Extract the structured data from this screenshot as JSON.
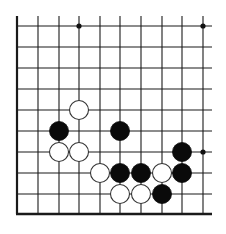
{
  "board": {
    "line_color": "#1a1a1a",
    "background": "#ffffff",
    "columns_x": [
      17,
      38,
      59,
      79,
      100,
      120,
      141,
      162,
      182,
      203
    ],
    "rows_y": [
      26,
      47,
      68,
      89,
      110,
      131,
      152,
      173,
      194,
      214
    ],
    "line_top": 16,
    "line_right": 212,
    "left_edge": true,
    "bottom_edge": true,
    "star_points": [
      {
        "col": 3,
        "row": 0
      },
      {
        "col": 9,
        "row": 0
      },
      {
        "col": 9,
        "row": 6
      }
    ],
    "stone_radius": 9.5,
    "stones": [
      {
        "color": "white",
        "col": 3,
        "row": 4
      },
      {
        "color": "black",
        "col": 2,
        "row": 5
      },
      {
        "color": "black",
        "col": 5,
        "row": 5
      },
      {
        "color": "white",
        "col": 2,
        "row": 6
      },
      {
        "color": "white",
        "col": 3,
        "row": 6
      },
      {
        "color": "black",
        "col": 8,
        "row": 6
      },
      {
        "color": "white",
        "col": 4,
        "row": 7
      },
      {
        "color": "black",
        "col": 5,
        "row": 7
      },
      {
        "color": "black",
        "col": 6,
        "row": 7
      },
      {
        "color": "white",
        "col": 7,
        "row": 7
      },
      {
        "color": "black",
        "col": 8,
        "row": 7
      },
      {
        "color": "white",
        "col": 5,
        "row": 8
      },
      {
        "color": "white",
        "col": 6,
        "row": 8
      },
      {
        "color": "black",
        "col": 7,
        "row": 8
      }
    ]
  }
}
